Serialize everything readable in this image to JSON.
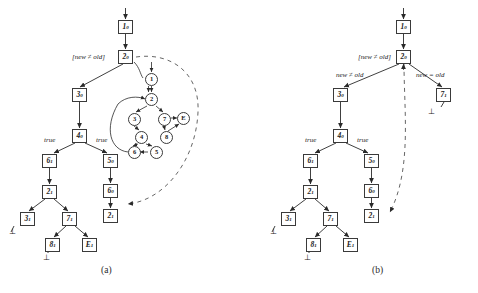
{
  "figure": {
    "captions": [
      {
        "id": "caption-a",
        "text": "(a)",
        "x": 101,
        "y": 266
      },
      {
        "id": "caption-b",
        "text": "(b)",
        "x": 372,
        "y": 266
      }
    ]
  },
  "panel_a": {
    "guard_label": {
      "text": "[new ≠ old]",
      "x": 72,
      "y": 54
    },
    "edge_labels": [
      {
        "name": "true-left",
        "text": "true",
        "x": 44,
        "y": 137
      },
      {
        "name": "true-right",
        "text": "true",
        "x": 96,
        "y": 137
      }
    ],
    "boxes": [
      {
        "name": "node-1-0",
        "base": "1",
        "sup": "0",
        "x": 118,
        "y": 20
      },
      {
        "name": "node-2-0",
        "base": "2",
        "sup": "0",
        "x": 118,
        "y": 50
      },
      {
        "name": "node-3-0",
        "base": "3",
        "sup": "0",
        "x": 72,
        "y": 88
      },
      {
        "name": "node-4-0",
        "base": "4",
        "sup": "0",
        "x": 72,
        "y": 129
      },
      {
        "name": "node-6-1",
        "base": "6",
        "sup": "1",
        "x": 42,
        "y": 154
      },
      {
        "name": "node-5-0",
        "base": "5",
        "sup": "0",
        "x": 103,
        "y": 154
      },
      {
        "name": "node-2-1",
        "base": "2",
        "sup": "1",
        "x": 42,
        "y": 185
      },
      {
        "name": "node-6-0",
        "base": "6",
        "sup": "0",
        "x": 103,
        "y": 184
      },
      {
        "name": "node-3-1",
        "base": "3",
        "sup": "1",
        "x": 20,
        "y": 212
      },
      {
        "name": "node-7-1",
        "base": "7",
        "sup": "1",
        "x": 62,
        "y": 212
      },
      {
        "name": "node-2-1b",
        "base": "2",
        "sup": "1",
        "x": 103,
        "y": 209
      },
      {
        "name": "node-8-1",
        "base": "8",
        "sup": "1",
        "x": 45,
        "y": 238
      },
      {
        "name": "node-E-1",
        "base": "E",
        "sup": "1",
        "x": 82,
        "y": 238
      }
    ],
    "circles": [
      {
        "name": "circle-1",
        "text": "1",
        "x": 145,
        "y": 73
      },
      {
        "name": "circle-2",
        "text": "2",
        "x": 145,
        "y": 93
      },
      {
        "name": "circle-3",
        "text": "3",
        "x": 128,
        "y": 113
      },
      {
        "name": "circle-7",
        "text": "7",
        "x": 158,
        "y": 113
      },
      {
        "name": "circle-E",
        "text": "E",
        "x": 177,
        "y": 112
      },
      {
        "name": "circle-4",
        "text": "4",
        "x": 135,
        "y": 131
      },
      {
        "name": "circle-8",
        "text": "8",
        "x": 160,
        "y": 131
      },
      {
        "name": "circle-6",
        "text": "6",
        "x": 128,
        "y": 146
      },
      {
        "name": "circle-5",
        "text": "5",
        "x": 150,
        "y": 146
      }
    ],
    "bottoms": [
      {
        "name": "bottom-left",
        "text": "⊥",
        "x": 9,
        "y": 228
      },
      {
        "name": "bottom-center",
        "text": "⊥",
        "x": 43,
        "y": 254
      }
    ]
  },
  "panel_b": {
    "guard_label": {
      "text": "[new ≠ old]",
      "x": 358,
      "y": 54
    },
    "branch_labels": [
      {
        "name": "branch-new-neq-old",
        "text": "new ≠ old",
        "x": 336,
        "y": 72
      },
      {
        "name": "branch-new-eq-old",
        "text": "new = old",
        "x": 416,
        "y": 72
      }
    ],
    "edge_labels": [
      {
        "name": "true-left",
        "text": "true",
        "x": 305,
        "y": 137
      },
      {
        "name": "true-right",
        "text": "true",
        "x": 357,
        "y": 137
      }
    ],
    "boxes": [
      {
        "name": "node-1-0",
        "base": "1",
        "sup": "0",
        "x": 396,
        "y": 20
      },
      {
        "name": "node-2-0",
        "base": "2",
        "sup": "0",
        "x": 396,
        "y": 50
      },
      {
        "name": "node-3-0",
        "base": "3",
        "sup": "0",
        "x": 333,
        "y": 88
      },
      {
        "name": "node-7-1t",
        "base": "7",
        "sup": "1",
        "x": 436,
        "y": 88
      },
      {
        "name": "node-4-0",
        "base": "4",
        "sup": "0",
        "x": 333,
        "y": 129
      },
      {
        "name": "node-6-1",
        "base": "6",
        "sup": "1",
        "x": 303,
        "y": 154
      },
      {
        "name": "node-5-0",
        "base": "5",
        "sup": "0",
        "x": 364,
        "y": 154
      },
      {
        "name": "node-2-1",
        "base": "2",
        "sup": "1",
        "x": 303,
        "y": 185
      },
      {
        "name": "node-6-0",
        "base": "6",
        "sup": "0",
        "x": 364,
        "y": 184
      },
      {
        "name": "node-3-1",
        "base": "3",
        "sup": "1",
        "x": 281,
        "y": 212
      },
      {
        "name": "node-7-1",
        "base": "7",
        "sup": "1",
        "x": 323,
        "y": 212
      },
      {
        "name": "node-2-1b",
        "base": "2",
        "sup": "1",
        "x": 364,
        "y": 209
      },
      {
        "name": "node-8-1",
        "base": "8",
        "sup": "1",
        "x": 306,
        "y": 238
      },
      {
        "name": "node-E-1",
        "base": "E",
        "sup": "1",
        "x": 343,
        "y": 238
      }
    ],
    "bottoms": [
      {
        "name": "bottom-right-top",
        "text": "⊥",
        "x": 428,
        "y": 108
      },
      {
        "name": "bottom-left",
        "text": "⊥",
        "x": 270,
        "y": 228
      },
      {
        "name": "bottom-center",
        "text": "⊥",
        "x": 304,
        "y": 254
      }
    ]
  },
  "colors": {
    "stroke": "#3a3a3a",
    "dashed": "#555555",
    "background": "#ffffff",
    "text": "#1a1a1a"
  }
}
